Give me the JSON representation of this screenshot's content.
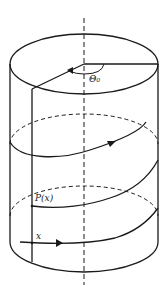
{
  "figure": {
    "type": "helical path on cylinder",
    "labels": {
      "angle": "Θ₀",
      "point": "P(x)",
      "start": "x"
    },
    "colors": {
      "stroke": "#1a1a1a",
      "background": "#ffffff"
    }
  }
}
